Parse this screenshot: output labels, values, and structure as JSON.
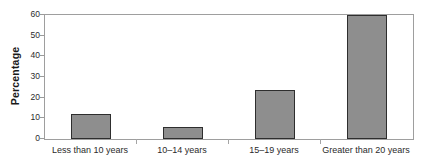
{
  "chart_data": {
    "type": "bar",
    "title": "",
    "subtitle": "",
    "xlabel": "",
    "ylabel": "Percentage",
    "ylim": [
      0,
      60
    ],
    "ytick_labels": [
      "0",
      "10",
      "20",
      "30",
      "40",
      "50",
      "60"
    ],
    "ytick_values": [
      0,
      10,
      20,
      30,
      40,
      50,
      60
    ],
    "grid": false,
    "legend": null,
    "categories": [
      "Less than 10 years",
      "10–14 years",
      "15–19 years",
      "Greater than 20 years"
    ],
    "values": [
      12,
      6,
      23.5,
      60
    ],
    "bar_color": "#8e8e8e",
    "bar_edge_color": "#2e2e2e",
    "axis_color": "#9e9e9e",
    "text_color": "#2b2b2b",
    "background": "#ffffff",
    "annotations": []
  }
}
